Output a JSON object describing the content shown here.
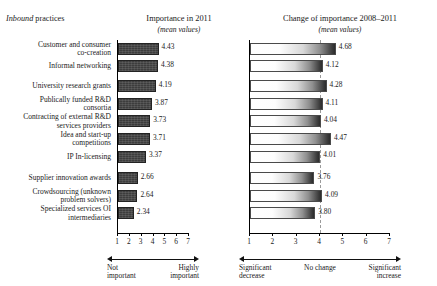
{
  "header": {
    "left_italic": "Inbound",
    "left_regular": " practices"
  },
  "charts": {
    "left": {
      "title": "Importance in 2011",
      "subtitle": "(mean values)",
      "anchor_low": "Not\nimportant",
      "anchor_high": "Highly\nimportant"
    },
    "right": {
      "title": "Change of importance 2008–2011",
      "subtitle": "(mean values)",
      "anchor_low": "Significant\ndecrease",
      "anchor_mid": "No change",
      "anchor_high": "Significant\nincrease"
    }
  },
  "chart_data": {
    "type": "bar",
    "orientation": "horizontal",
    "categories": [
      "Customer  and consumer\nco-creation",
      "Informal networking",
      "University research grants",
      "Publically funded R&D\nconsortia",
      "Contracting of external R&D\nservices providers",
      "Idea and start-up\ncompetitions",
      "IP In-licensing",
      "Supplier innovation awards",
      "Crowdsourcing (unknown\nproblem solvers)",
      "Specialized services OI\nintermediaries"
    ],
    "series": [
      {
        "name": "Importance in 2011",
        "xlabel": "",
        "xlim": [
          1,
          7
        ],
        "ticks": [
          1,
          2,
          3,
          4,
          5,
          6,
          7
        ],
        "values": [
          4.43,
          4.38,
          4.19,
          3.87,
          3.73,
          3.71,
          3.37,
          2.66,
          2.64,
          2.34
        ]
      },
      {
        "name": "Change of importance 2008–2011",
        "xlabel": "",
        "xlim": [
          1,
          7
        ],
        "ticks": [
          1,
          2,
          3,
          4,
          5,
          6,
          7
        ],
        "reference_line": 4,
        "values": [
          4.68,
          4.12,
          4.28,
          4.11,
          4.04,
          4.47,
          4.01,
          3.76,
          4.09,
          3.8
        ]
      }
    ],
    "grid": false,
    "legend": "none"
  }
}
